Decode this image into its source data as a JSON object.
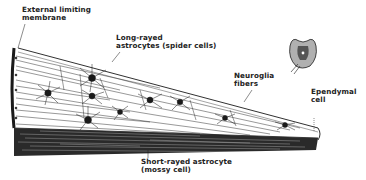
{
  "figure": {
    "labels": {
      "external_limiting_membrane": [
        "External limiting",
        "membrane"
      ],
      "long_rayed_astrocytes": [
        "Long-rayed",
        "astrocytes (spider cells)"
      ],
      "neuroglia_fibers": [
        "Neuroglia",
        "fibers"
      ],
      "ependymal_cell": [
        "Ependymal",
        "cell"
      ],
      "short_rayed_astrocyte": [
        "Short-rayed astrocyte",
        "(mossy cell)"
      ]
    },
    "inset": "spinal-cord-cross-section"
  },
  "colors": {
    "ink": "#1a1a1a",
    "background": "#ffffff",
    "inset_fill": "#9a9a9a"
  }
}
